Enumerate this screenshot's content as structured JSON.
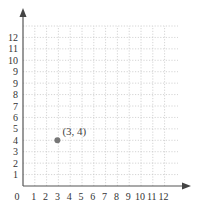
{
  "chart_data": {
    "type": "scatter",
    "title": "",
    "xlabel": "",
    "ylabel": "",
    "xlim": [
      0,
      12
    ],
    "ylim": [
      0,
      12
    ],
    "grid": true,
    "origin_label": "0",
    "x_tick_labels": [
      "1",
      "2",
      "3",
      "4",
      "5",
      "6",
      "7",
      "8",
      "9",
      "10",
      "11",
      "12"
    ],
    "y_tick_labels": [
      "1",
      "2",
      "3",
      "4",
      "5",
      "6",
      "7",
      "8",
      "9",
      "9",
      "10",
      "11",
      "12"
    ],
    "points": [
      {
        "x": 3,
        "y": 4,
        "label": "(3, 4)"
      }
    ],
    "colors": {
      "point": "#777777",
      "axis": "#555555",
      "grid": "#c9c9c9"
    }
  }
}
